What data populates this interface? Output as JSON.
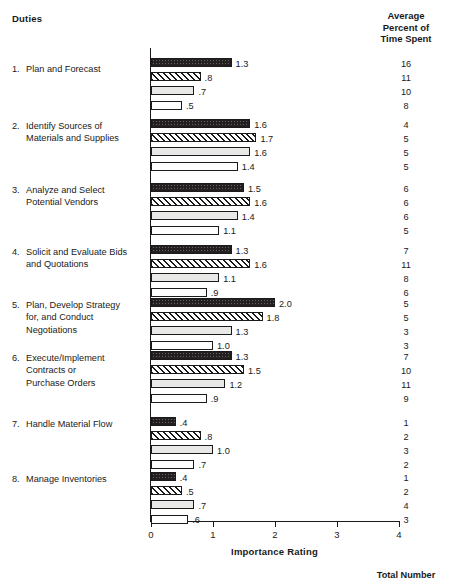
{
  "header": {
    "duties_label": "Duties",
    "right_column_lines": [
      "Average",
      "Percent of",
      "Time Spent"
    ]
  },
  "footer": {
    "total_number_label": "Total Number"
  },
  "chart_data": {
    "type": "bar",
    "orientation": "horizontal",
    "title": "",
    "xlabel": "Importance Rating",
    "ylabel": "Duties",
    "xlim": [
      0,
      4
    ],
    "xticks": [
      0,
      1,
      2,
      3,
      4
    ],
    "xtick_labels": [
      "0",
      "1",
      "2",
      "3",
      "4"
    ],
    "grid": false,
    "legend": "none",
    "series_styles": [
      "solid-dark",
      "diagonal-hatch",
      "light-grey",
      "white"
    ],
    "secondary_axis_label": "Average Percent of Time Spent",
    "categories": [
      "1. Plan and Forecast",
      "2. Identify Sources of Materials and Supplies",
      "3. Analyze and Select Potential Vendors",
      "4. Solicit and Evaluate Bids and Quotations",
      "5. Plan, Develop Strategy for, and Conduct Negotiations",
      "6. Execute/Implement Contracts or Purchase Orders",
      "7. Handle Material Flow",
      "8. Manage Inventories"
    ],
    "groups": [
      {
        "number": "1.",
        "label_lines": [
          "Plan and Forecast"
        ],
        "importance": [
          1.3,
          0.8,
          0.7,
          0.5
        ],
        "importance_labels": [
          "1.3",
          ".8",
          ".7",
          ".5"
        ],
        "percent_time": [
          16,
          11,
          10,
          8
        ],
        "percent_time_labels": [
          "16",
          "11",
          "10",
          "8"
        ]
      },
      {
        "number": "2.",
        "label_lines": [
          "Identify Sources of",
          "Materials and Supplies"
        ],
        "importance": [
          1.6,
          1.7,
          1.6,
          1.4
        ],
        "importance_labels": [
          "1.6",
          "1.7",
          "1.6",
          "1.4"
        ],
        "percent_time": [
          4,
          5,
          5,
          5
        ],
        "percent_time_labels": [
          "4",
          "5",
          "5",
          "5"
        ]
      },
      {
        "number": "3.",
        "label_lines": [
          "Analyze and Select",
          "Potential Vendors"
        ],
        "importance": [
          1.5,
          1.6,
          1.4,
          1.1
        ],
        "importance_labels": [
          "1.5",
          "1.6",
          "1.4",
          "1.1"
        ],
        "percent_time": [
          6,
          6,
          6,
          5
        ],
        "percent_time_labels": [
          "6",
          "6",
          "6",
          "5"
        ]
      },
      {
        "number": "4.",
        "label_lines": [
          "Solicit and Evaluate Bids",
          "and Quotations"
        ],
        "importance": [
          1.3,
          1.6,
          1.1,
          0.9
        ],
        "importance_labels": [
          "1.3",
          "1.6",
          "1.1",
          ".9"
        ],
        "percent_time": [
          7,
          11,
          8,
          6
        ],
        "percent_time_labels": [
          "7",
          "11",
          "8",
          "6"
        ]
      },
      {
        "number": "5.",
        "label_lines": [
          "Plan, Develop Strategy",
          "for, and Conduct",
          "Negotiations"
        ],
        "importance": [
          2.0,
          1.8,
          1.3,
          1.0
        ],
        "importance_labels": [
          "2.0",
          "1.8",
          "1.3",
          "1.0"
        ],
        "percent_time": [
          5,
          5,
          3,
          3
        ],
        "percent_time_labels": [
          "5",
          "5",
          "3",
          "3"
        ]
      },
      {
        "number": "6.",
        "label_lines": [
          "Execute/Implement",
          "Contracts or",
          "Purchase Orders"
        ],
        "importance": [
          1.3,
          1.5,
          1.2,
          0.9
        ],
        "importance_labels": [
          "1.3",
          "1.5",
          "1.2",
          ".9"
        ],
        "percent_time": [
          7,
          10,
          11,
          9
        ],
        "percent_time_labels": [
          "7",
          "10",
          "11",
          "9"
        ]
      },
      {
        "number": "7.",
        "label_lines": [
          "Handle Material Flow"
        ],
        "importance": [
          0.4,
          0.8,
          1.0,
          0.7
        ],
        "importance_labels": [
          ".4",
          ".8",
          "1.0",
          ".7"
        ],
        "percent_time": [
          1,
          2,
          3,
          2
        ],
        "percent_time_labels": [
          "1",
          "2",
          "3",
          "2"
        ]
      },
      {
        "number": "8.",
        "label_lines": [
          "Manage Inventories"
        ],
        "importance": [
          0.4,
          0.5,
          0.7,
          0.6
        ],
        "importance_labels": [
          ".4",
          ".5",
          ".7",
          ".6"
        ],
        "percent_time": [
          1,
          2,
          4,
          3
        ],
        "percent_time_labels": [
          "1",
          "2",
          "4",
          "3"
        ]
      }
    ]
  }
}
